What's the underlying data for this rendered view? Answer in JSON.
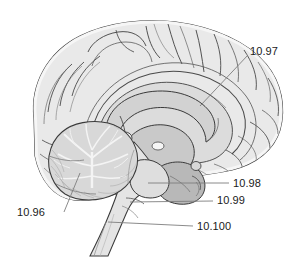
{
  "figure": {
    "type": "anatomical-illustration",
    "view": "sagittal",
    "background_color": "#ffffff",
    "line_color": "#3a3a3a",
    "leader_line_color": "#808080",
    "text_color": "#1a1a1a",
    "palette": {
      "cortex_fill": "#e9e9e9",
      "cortex_light": "#f2f2f2",
      "white_matter": "#dcdcdc",
      "corpus_callosum": "#d2d2d2",
      "thalamus": "#c9c9c9",
      "midbrain": "#b8b8b8",
      "cerebellum": "#d8d8d8",
      "brainstem": "#e4e4e4",
      "ventricle": "#f7f7f7"
    }
  },
  "callouts": [
    {
      "id": "1096",
      "label": "10.96",
      "structure": "cerebellum",
      "text_x": 17,
      "text_y": 206,
      "leader": {
        "x1": 64,
        "y1": 212,
        "x2": 80,
        "y2": 173
      }
    },
    {
      "id": "1097",
      "label": "10.97",
      "structure": "corpus-callosum",
      "text_x": 250,
      "text_y": 45,
      "leader": {
        "x1": 248,
        "y1": 55,
        "x2": 200,
        "y2": 106
      }
    },
    {
      "id": "1098",
      "label": "10.98",
      "structure": "pons",
      "text_x": 233,
      "text_y": 177,
      "leader": {
        "x1": 229,
        "y1": 183,
        "x2": 148,
        "y2": 183
      }
    },
    {
      "id": "1099",
      "label": "10.99",
      "structure": "medulla-oblongata",
      "text_x": 217,
      "text_y": 194,
      "leader": {
        "x1": 213,
        "y1": 201,
        "x2": 130,
        "y2": 202
      }
    },
    {
      "id": "10100",
      "label": "10.100",
      "structure": "spinal-cord",
      "text_x": 197,
      "text_y": 220,
      "leader": {
        "x1": 193,
        "y1": 226,
        "x2": 108,
        "y2": 222
      }
    }
  ]
}
